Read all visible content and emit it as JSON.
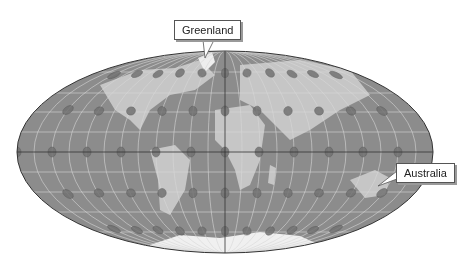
{
  "figure": {
    "projection": "Hammer (equal-area) world projection with Tissot indicatrices",
    "ocean_color": "#8c8c8c",
    "land_color": "#c8c8c8",
    "ice_color": "#f2f2f2",
    "graticule_color": "#d8d8d8",
    "border_color": "#333333",
    "indicatrix_color": "#6f6f6f"
  },
  "labels": {
    "greenland": "Greenland",
    "australia": "Australia"
  }
}
